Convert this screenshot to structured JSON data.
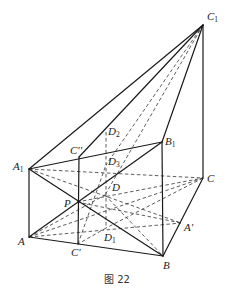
{
  "figure": {
    "caption": "图 22",
    "points": {
      "C1": {
        "label": "C",
        "sub": "1",
        "x": 203,
        "y": 25,
        "lx": 207,
        "ly": 20
      },
      "A1": {
        "label": "A",
        "sub": "1",
        "x": 29,
        "y": 169,
        "lx": 13,
        "ly": 170
      },
      "B1": {
        "label": "B",
        "sub": "1",
        "x": 162,
        "y": 142,
        "lx": 165,
        "ly": 145
      },
      "C2": {
        "label": "C''",
        "sub": "",
        "x": 79,
        "y": 157,
        "lx": 70,
        "ly": 154
      },
      "D2": {
        "label": "D",
        "sub": "2",
        "x": 106,
        "y": 132,
        "lx": 108,
        "ly": 135
      },
      "D3": {
        "label": "D",
        "sub": "3",
        "x": 106,
        "y": 165,
        "lx": 108,
        "ly": 165
      },
      "C": {
        "label": "C",
        "sub": "",
        "x": 203,
        "y": 178,
        "lx": 207,
        "ly": 182
      },
      "D": {
        "label": "D",
        "sub": "",
        "x": 105,
        "y": 195,
        "lx": 112,
        "ly": 191
      },
      "P": {
        "label": "P",
        "sub": "",
        "x": 77,
        "y": 202,
        "lx": 64,
        "ly": 207
      },
      "A'": {
        "label": "A'",
        "sub": "",
        "x": 181,
        "y": 223,
        "lx": 184,
        "ly": 231
      },
      "D1": {
        "label": "D",
        "sub": "1",
        "x": 106,
        "y": 228,
        "lx": 104,
        "ly": 241
      },
      "A": {
        "label": "A",
        "sub": "",
        "x": 29,
        "y": 237,
        "lx": 18,
        "ly": 245
      },
      "C'": {
        "label": "C'",
        "sub": "",
        "x": 78,
        "y": 244,
        "lx": 71,
        "ly": 256
      },
      "B": {
        "label": "B",
        "sub": "",
        "x": 163,
        "y": 256,
        "lx": 163,
        "ly": 269
      }
    },
    "solid_segments": [
      [
        "A1",
        "C1"
      ],
      [
        "C2",
        "C1"
      ],
      [
        "B1",
        "C1"
      ],
      [
        "C1",
        "C"
      ],
      [
        "A1",
        "B1"
      ],
      [
        "A1",
        "A"
      ],
      [
        "A",
        "B"
      ],
      [
        "B",
        "C"
      ],
      [
        "B1",
        "B"
      ],
      [
        "C2",
        "C'"
      ],
      [
        "A1",
        "B"
      ],
      [
        "A",
        "B1"
      ]
    ],
    "dashed_segments": [
      [
        "D2",
        "D1"
      ],
      [
        "C1",
        "D3"
      ],
      [
        "C1",
        "D"
      ],
      [
        "A1",
        "C"
      ],
      [
        "A",
        "C"
      ],
      [
        "A1",
        "A'"
      ],
      [
        "A",
        "A'"
      ],
      [
        "C'",
        "D3"
      ],
      [
        "P",
        "C"
      ],
      [
        "A",
        "D"
      ],
      [
        "C",
        "D1"
      ],
      [
        "D",
        "B"
      ],
      [
        "P",
        "A'"
      ],
      [
        "D1",
        "C'"
      ]
    ]
  }
}
